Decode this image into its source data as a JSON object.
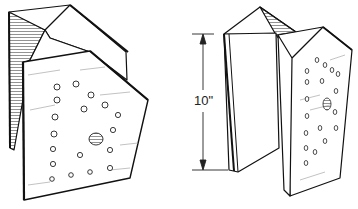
{
  "figure": {
    "left_view": {
      "name": "bracket-view-left"
    },
    "right_view": {
      "name": "bracket-view-right"
    },
    "dimension": {
      "label": "10\"",
      "target": "height of bracket"
    }
  }
}
